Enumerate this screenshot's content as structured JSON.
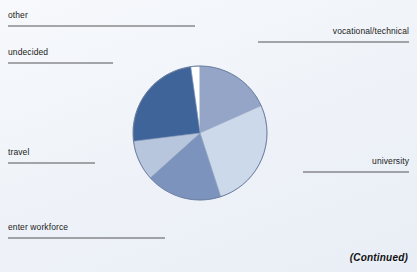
{
  "figure": {
    "continued_note": "(Continued)",
    "background_color": "#f1f5fa"
  },
  "chart_data": {
    "type": "pie",
    "title": "",
    "subtitle": "",
    "xlabel": "",
    "ylabel": "",
    "legend_position": "callout-labels",
    "grid": false,
    "start_angle_deg": 352,
    "direction": "clockwise",
    "center": {
      "x": 200,
      "y": 133
    },
    "radius": 67,
    "categories": [
      "other",
      "vocational/technical",
      "university",
      "enter workforce",
      "travel",
      "undecided"
    ],
    "values": [
      8,
      66,
      96,
      66,
      35,
      89
    ],
    "units": "degrees",
    "percentages": [
      2.2,
      18.3,
      26.7,
      18.3,
      9.7,
      24.7
    ],
    "slices": [
      {
        "label": "other",
        "start_deg": 352,
        "end_deg": 360,
        "sweep_deg": 8,
        "percent": 2.2,
        "color": "#ffffff"
      },
      {
        "label": "vocational/technical",
        "start_deg": 0,
        "end_deg": 66,
        "sweep_deg": 66,
        "percent": 18.3,
        "color": "#95a5c8"
      },
      {
        "label": "university",
        "start_deg": 66,
        "end_deg": 162,
        "sweep_deg": 96,
        "percent": 26.7,
        "color": "#ccd9ea"
      },
      {
        "label": "enter workforce",
        "start_deg": 162,
        "end_deg": 228,
        "sweep_deg": 66,
        "percent": 18.3,
        "color": "#7b93bd"
      },
      {
        "label": "travel",
        "start_deg": 228,
        "end_deg": 263,
        "sweep_deg": 35,
        "percent": 9.7,
        "color": "#b8c6dd"
      },
      {
        "label": "undecided",
        "start_deg": 263,
        "end_deg": 352,
        "sweep_deg": 89,
        "percent": 24.7,
        "color": "#3f6499"
      }
    ],
    "annotations": [
      {
        "text": "other",
        "side": "left"
      },
      {
        "text": "undecided",
        "side": "left"
      },
      {
        "text": "travel",
        "side": "left"
      },
      {
        "text": "enter workforce",
        "side": "left"
      },
      {
        "text": "vocational/technical",
        "side": "right"
      },
      {
        "text": "university",
        "side": "right"
      }
    ]
  },
  "callouts": {
    "other": "other",
    "undecided": "undecided",
    "travel": "travel",
    "enter_workforce": "enter workforce",
    "vocational_technical": "vocational/technical",
    "university": "university"
  }
}
